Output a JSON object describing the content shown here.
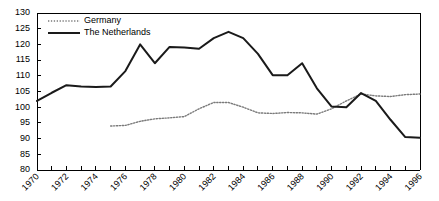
{
  "chart_data": {
    "type": "line",
    "title": "",
    "xlabel": "",
    "ylabel": "",
    "ylim": [
      80,
      130
    ],
    "xlim": [
      1970,
      1996
    ],
    "y_ticks": [
      80,
      85,
      90,
      95,
      100,
      105,
      110,
      115,
      120,
      125,
      130
    ],
    "x_ticks": [
      1970,
      1971,
      1972,
      1973,
      1974,
      1975,
      1976,
      1977,
      1978,
      1979,
      1980,
      1981,
      1982,
      1983,
      1984,
      1985,
      1986,
      1987,
      1988,
      1989,
      1990,
      1991,
      1992,
      1993,
      1994,
      1995,
      1996
    ],
    "x_tick_labels": [
      "1970",
      "1972",
      "1974",
      "1976",
      "1978",
      "1980",
      "1982",
      "1984",
      "1986",
      "1988",
      "1990",
      "1992",
      "1994",
      "1996"
    ],
    "x_tick_label_years": [
      1970,
      1972,
      1974,
      1976,
      1978,
      1980,
      1982,
      1984,
      1986,
      1988,
      1990,
      1992,
      1994,
      1996
    ],
    "grid": false,
    "legend_position": "top-left",
    "series": [
      {
        "name": "Germany",
        "style": "dotted",
        "color": "#7a7a7a",
        "x": [
          1975,
          1976,
          1977,
          1978,
          1979,
          1980,
          1981,
          1982,
          1983,
          1984,
          1985,
          1986,
          1987,
          1988,
          1989,
          1990,
          1991,
          1992,
          1993,
          1994,
          1995,
          1996
        ],
        "values": [
          94.0,
          94.2,
          95.5,
          96.3,
          96.6,
          97.0,
          99.5,
          101.5,
          101.5,
          100.0,
          98.2,
          98.0,
          98.3,
          98.2,
          97.8,
          99.5,
          102.0,
          104.2,
          103.6,
          103.4,
          104.0,
          104.2
        ]
      },
      {
        "name": "The Netherlands",
        "style": "solid",
        "color": "#1a1a1a",
        "x": [
          1970,
          1971,
          1972,
          1973,
          1974,
          1975,
          1976,
          1977,
          1978,
          1979,
          1980,
          1981,
          1982,
          1983,
          1984,
          1985,
          1986,
          1987,
          1988,
          1989,
          1990,
          1991,
          1992,
          1993,
          1994,
          1995,
          1996
        ],
        "values": [
          102.0,
          104.6,
          107.0,
          106.6,
          106.4,
          106.6,
          111.5,
          120.0,
          114.0,
          119.2,
          119.0,
          118.6,
          122.0,
          124.0,
          122.0,
          117.0,
          110.2,
          110.2,
          114.0,
          106.0,
          100.2,
          100.0,
          104.5,
          102.0,
          96.0,
          90.5,
          90.3
        ]
      }
    ],
    "legend": [
      {
        "label": "Germany",
        "style": "dotted"
      },
      {
        "label": "The Netherlands",
        "style": "solid"
      }
    ]
  }
}
